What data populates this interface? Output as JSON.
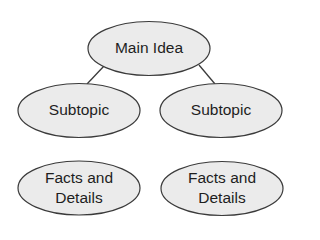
{
  "diagram": {
    "type": "concept-map",
    "colors": {
      "node_fill": "#ebebeb",
      "node_stroke": "#3a3a3a",
      "text": "#1e1e1e",
      "background": "#ffffff"
    },
    "nodes": {
      "main": {
        "label": "Main Idea"
      },
      "subtopic_left": {
        "label": "Subtopic"
      },
      "subtopic_right": {
        "label": "Subtopic"
      },
      "details_left": {
        "line1": "Facts and",
        "line2": "Details"
      },
      "details_right": {
        "line1": "Facts and",
        "line2": "Details"
      }
    },
    "edges": [
      {
        "from": "main",
        "to": "subtopic_left"
      },
      {
        "from": "main",
        "to": "subtopic_right"
      }
    ]
  }
}
